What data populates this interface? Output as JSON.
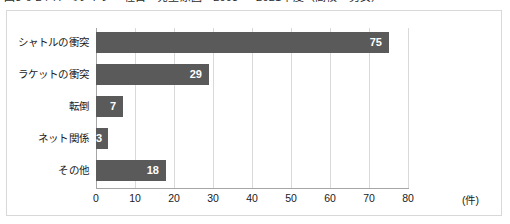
{
  "title": "図3-6-2 バドミントン　種目・発生原因　2003 ～ 2021年度（高校・男女）",
  "chart_data": {
    "type": "bar",
    "orientation": "horizontal",
    "title": "図3-6-2 バドミントン　種目・発生原因　2003 ～ 2021年度（高校・男女）",
    "categories": [
      "シャトルの衝突",
      "ラケットの衝突",
      "転倒",
      "ネット関係",
      "その他"
    ],
    "values": [
      75,
      29,
      7,
      3,
      18
    ],
    "value_labels": [
      "75",
      "29",
      "7",
      "3",
      "18"
    ],
    "xlabel": "",
    "ylabel": "",
    "unit": "(件)",
    "xlim": [
      0,
      80
    ],
    "xticks": [
      0,
      10,
      20,
      30,
      40,
      50,
      60,
      70,
      80
    ],
    "xtick_labels": [
      "0",
      "10",
      "20",
      "30",
      "40",
      "50",
      "60",
      "70",
      "80"
    ],
    "grid": "vertical",
    "legend": null,
    "bar_color": "#5a5a5a",
    "value_label_color": "#ffffff",
    "gridline_color": "#d9d9d9",
    "axis_color": "#a6a6a6",
    "background": "#ffffff",
    "border_color": "#d8d8d8"
  }
}
